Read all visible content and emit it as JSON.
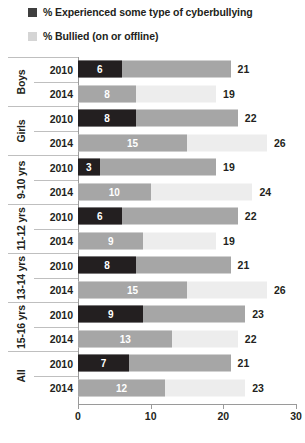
{
  "legend": {
    "items": [
      {
        "label": "% Experienced some type of cyberbullying",
        "color": "#3f3f3f",
        "name": "legend-cyberbullying"
      },
      {
        "label": "% Bullied (on or offline)",
        "color": "#d5d5d5",
        "name": "legend-bullied"
      }
    ]
  },
  "axis": {
    "ticks": [
      "0",
      "10",
      "20",
      "30"
    ],
    "min": 0,
    "max": 30
  },
  "groups": [
    {
      "label": "Boys",
      "rows": [
        0,
        1
      ]
    },
    {
      "label": "Girls",
      "rows": [
        2,
        3
      ]
    },
    {
      "label": "9-10 yrs",
      "rows": [
        4,
        5
      ]
    },
    {
      "label": "11-12 yrs",
      "rows": [
        6,
        7
      ]
    },
    {
      "label": "13-14 yrs",
      "rows": [
        8,
        9
      ]
    },
    {
      "label": "15-16 yrs",
      "rows": [
        10,
        11
      ]
    },
    {
      "label": "All",
      "rows": [
        12,
        13
      ]
    }
  ],
  "rows": [
    {
      "year": "2010",
      "cyber": "6",
      "bullied": "21"
    },
    {
      "year": "2014",
      "cyber": "8",
      "bullied": "19"
    },
    {
      "year": "2010",
      "cyber": "8",
      "bullied": "22"
    },
    {
      "year": "2014",
      "cyber": "15",
      "bullied": "26"
    },
    {
      "year": "2010",
      "cyber": "3",
      "bullied": "19"
    },
    {
      "year": "2014",
      "cyber": "10",
      "bullied": "24"
    },
    {
      "year": "2010",
      "cyber": "6",
      "bullied": "22"
    },
    {
      "year": "2014",
      "cyber": "9",
      "bullied": "19"
    },
    {
      "year": "2010",
      "cyber": "8",
      "bullied": "21"
    },
    {
      "year": "2014",
      "cyber": "15",
      "bullied": "26"
    },
    {
      "year": "2010",
      "cyber": "9",
      "bullied": "23"
    },
    {
      "year": "2014",
      "cyber": "13",
      "bullied": "22"
    },
    {
      "year": "2010",
      "cyber": "7",
      "bullied": "21"
    },
    {
      "year": "2014",
      "cyber": "12",
      "bullied": "23"
    }
  ],
  "colors": {
    "cyber_2010": "#231f20",
    "cyber_2014": "#a6a6a6",
    "bullied_2010": "#a6a6a6",
    "bullied_2014": "#ededed",
    "axis": "#9a9a9a",
    "divider": "#bfbfbf",
    "text": "#231f20"
  },
  "chart_data": {
    "type": "bar",
    "title": "",
    "xlabel": "",
    "ylabel": "",
    "xlim": [
      0,
      30
    ],
    "grid": false,
    "legend_position": "top-left",
    "orientation": "horizontal",
    "categories": [
      "Boys 2010",
      "Boys 2014",
      "Girls 2010",
      "Girls 2014",
      "9-10 yrs 2010",
      "9-10 yrs 2014",
      "11-12 yrs 2010",
      "11-12 yrs 2014",
      "13-14 yrs 2010",
      "13-14 yrs 2014",
      "15-16 yrs 2010",
      "15-16 yrs 2014",
      "All 2010",
      "All 2014"
    ],
    "series": [
      {
        "name": "% Experienced some type of cyberbullying",
        "values": [
          6,
          8,
          8,
          15,
          3,
          10,
          6,
          9,
          8,
          15,
          9,
          13,
          7,
          12
        ]
      },
      {
        "name": "% Bullied (on or offline)",
        "values": [
          21,
          19,
          22,
          26,
          19,
          24,
          22,
          19,
          21,
          26,
          23,
          22,
          21,
          23
        ]
      }
    ],
    "xticks": [
      0,
      10,
      20,
      30
    ]
  }
}
